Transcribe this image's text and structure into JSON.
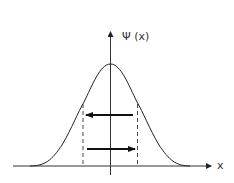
{
  "diagram": {
    "y_axis_label": "Ψ (x)",
    "x_axis_label": "x",
    "curve": "gaussian",
    "arrows": [
      {
        "direction": "left",
        "y": 115
      },
      {
        "direction": "right",
        "y": 149
      }
    ],
    "colors": {
      "stroke": "#222222",
      "background": "#ffffff"
    }
  }
}
